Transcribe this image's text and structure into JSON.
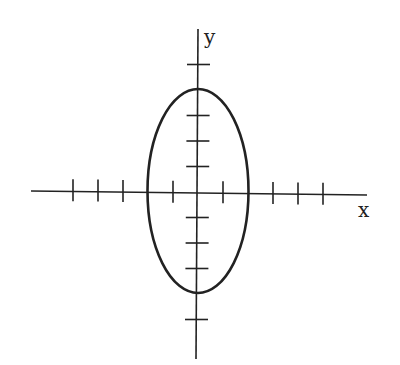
{
  "diagram": {
    "type": "ellipse-on-axes",
    "x_axis_label": "x",
    "y_axis_label": "y",
    "origin_px": [
      197,
      192
    ],
    "unit_px": 25,
    "x_ticks": [
      -5,
      -4,
      -3,
      -2,
      -1,
      1,
      2,
      3,
      4,
      5
    ],
    "y_ticks": [
      5,
      4,
      3,
      2,
      1,
      -1,
      -2,
      -3,
      -4,
      -5
    ],
    "ellipse": {
      "center": [
        0,
        0
      ],
      "semi_axis_x": 2,
      "semi_axis_y": 4
    },
    "colors": {
      "stroke": "#222222",
      "background": "#ffffff"
    }
  }
}
